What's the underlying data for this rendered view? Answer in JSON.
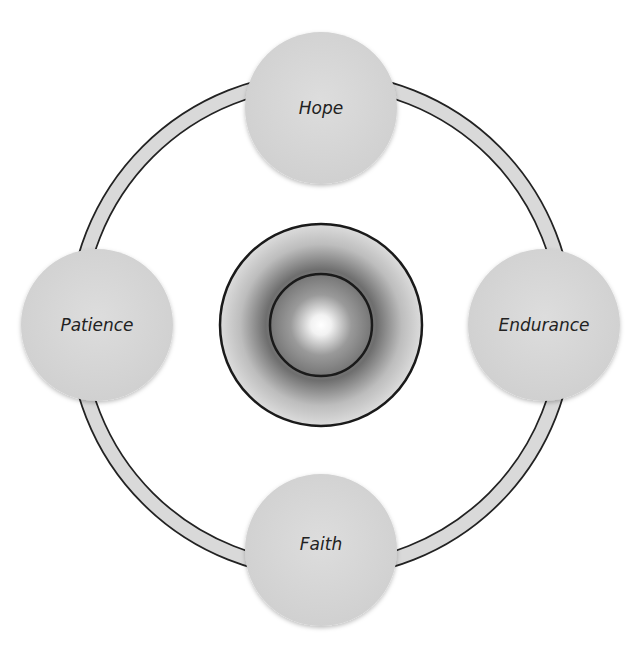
{
  "diagram": {
    "type": "cycle",
    "center": {
      "label": ""
    },
    "nodes": [
      {
        "id": "top",
        "label": "Hope"
      },
      {
        "id": "right",
        "label": "Endurance"
      },
      {
        "id": "bottom",
        "label": "Faith"
      },
      {
        "id": "left",
        "label": "Patience"
      }
    ]
  },
  "colors": {
    "node_fill": "#d6d6d6",
    "ring_fill": "#d9d9d9",
    "stroke": "#222222",
    "text": "#222222"
  }
}
